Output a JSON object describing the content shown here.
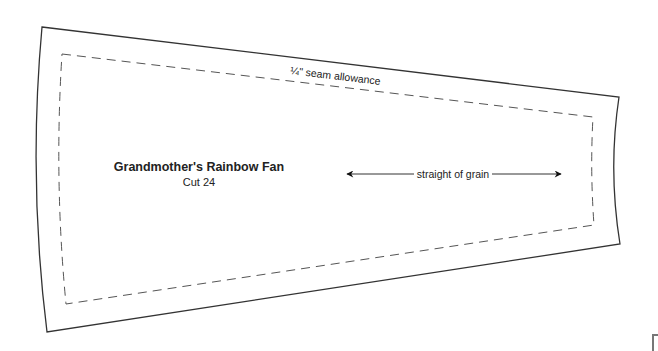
{
  "template": {
    "title": "Grandmother's Rainbow Fan",
    "cut_instruction": "Cut 24",
    "seam_label": "¼\" seam allowance",
    "grain_label": "straight of grain",
    "icons": {
      "grain_arrow": "double-headed-arrow-icon"
    },
    "colors": {
      "outline": "#333333",
      "seam_line": "#555555",
      "text": "#222222",
      "background": "#ffffff"
    }
  }
}
